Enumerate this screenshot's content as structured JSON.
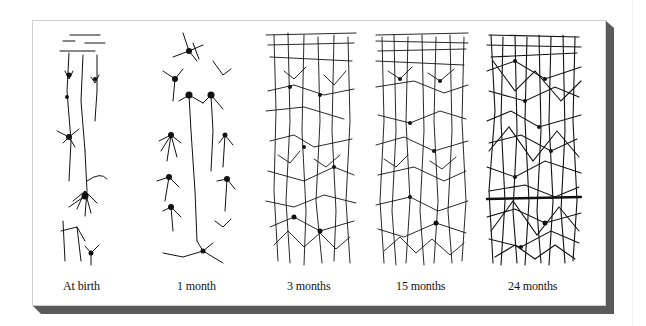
{
  "figure": {
    "panels": [
      {
        "id": "at-birth",
        "label": "At birth",
        "density": 1
      },
      {
        "id": "1-month",
        "label": "1 month",
        "density": 2
      },
      {
        "id": "3-months",
        "label": "3 months",
        "density": 4
      },
      {
        "id": "15-months",
        "label": "15 months",
        "density": 5
      },
      {
        "id": "24-months",
        "label": "24 months",
        "density": 6
      }
    ]
  },
  "colors": {
    "ink": "#111111",
    "panel_bg": "#ffffff",
    "panel_border": "#cfcfcf",
    "shadow": "#5a5a5a"
  }
}
